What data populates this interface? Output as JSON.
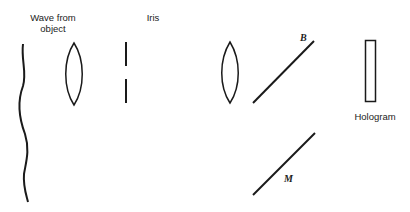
{
  "diagram": {
    "labels": {
      "wave_line1": "Wave from",
      "wave_line2": "object",
      "iris": "Iris",
      "beam_splitter": "B",
      "mirror": "M",
      "hologram": "Hologram"
    },
    "components": [
      {
        "id": "wavefront",
        "type": "wavy-line"
      },
      {
        "id": "lens-1",
        "type": "convex-lens"
      },
      {
        "id": "iris",
        "type": "aperture"
      },
      {
        "id": "lens-2",
        "type": "convex-lens"
      },
      {
        "id": "beam-splitter",
        "type": "diagonal-line",
        "label": "B"
      },
      {
        "id": "mirror",
        "type": "diagonal-line",
        "label": "M"
      },
      {
        "id": "hologram",
        "type": "rectangle"
      }
    ],
    "stroke_color": "#1a1a1a"
  }
}
